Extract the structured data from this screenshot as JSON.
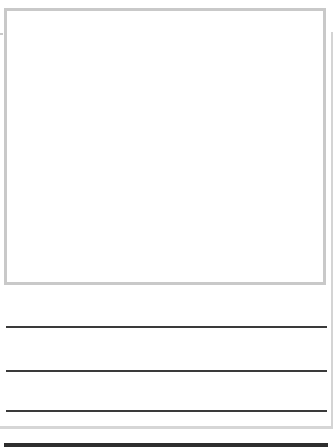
{
  "worksheet": {
    "type": "draw-and-write template",
    "picture_box": {
      "label": "",
      "border_color": "#c9c9c9"
    },
    "writing_lines": [
      {
        "index": 1,
        "text": ""
      },
      {
        "index": 2,
        "text": ""
      },
      {
        "index": 3,
        "text": ""
      }
    ],
    "line_color": "#3a3a3a",
    "frame_color": "#d4d4d4",
    "bottom_bar_color": "#2e2e2e"
  }
}
